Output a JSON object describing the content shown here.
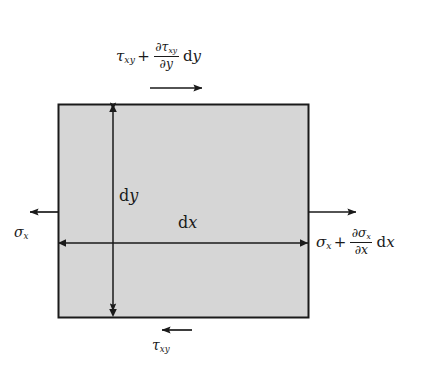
{
  "figure": {
    "background_color": "#ffffff",
    "element": {
      "fill_color": "#d6d6d6",
      "stroke_color": "#1a1a1a",
      "x": 58,
      "y": 104,
      "width": 250,
      "height": 213
    },
    "labels": {
      "tau_top": {
        "base": "τ",
        "base_sub": "xy",
        "operator": "+",
        "numerator": "∂τ",
        "numerator_sub": "xy",
        "denominator": "∂y",
        "differential": "d",
        "differential_var": "y",
        "plain_text": "τxy + ∂τxy/∂y dy"
      },
      "sigma_left": {
        "base": "σ",
        "base_sub": "x",
        "plain_text": "σx"
      },
      "sigma_right": {
        "base": "σ",
        "base_sub": "x",
        "operator": "+",
        "numerator": "∂σ",
        "numerator_sub": "x",
        "denominator": "∂x",
        "differential": "d",
        "differential_var": "x",
        "plain_text": "σx + ∂σx/∂x dx"
      },
      "dy": {
        "differential": "d",
        "variable": "y",
        "plain_text": "dy"
      },
      "dx": {
        "differential": "d",
        "variable": "x",
        "plain_text": "dx"
      },
      "tau_bottom": {
        "base": "τ",
        "base_sub": "xy",
        "plain_text": "τxy"
      }
    },
    "arrows": [
      {
        "name": "tau-top-arrow",
        "direction": "right",
        "x1": 150,
        "y1": 88,
        "x2": 206,
        "y2": 88
      },
      {
        "name": "sigma-left-arrow",
        "direction": "left",
        "x1": 58,
        "y1": 212,
        "x2": 26,
        "y2": 212
      },
      {
        "name": "sigma-right-arrow",
        "direction": "right",
        "x1": 308,
        "y1": 212,
        "x2": 360,
        "y2": 212
      },
      {
        "name": "tau-bottom-arrow",
        "direction": "left",
        "x1": 192,
        "y1": 330,
        "x2": 158,
        "y2": 330
      }
    ],
    "dimensions": [
      {
        "name": "dy-dimension-line",
        "orientation": "vertical",
        "x": 113,
        "y1": 104,
        "y2": 317
      },
      {
        "name": "dx-dimension-line",
        "orientation": "horizontal",
        "y": 243,
        "x1": 58,
        "x2": 308
      }
    ]
  }
}
